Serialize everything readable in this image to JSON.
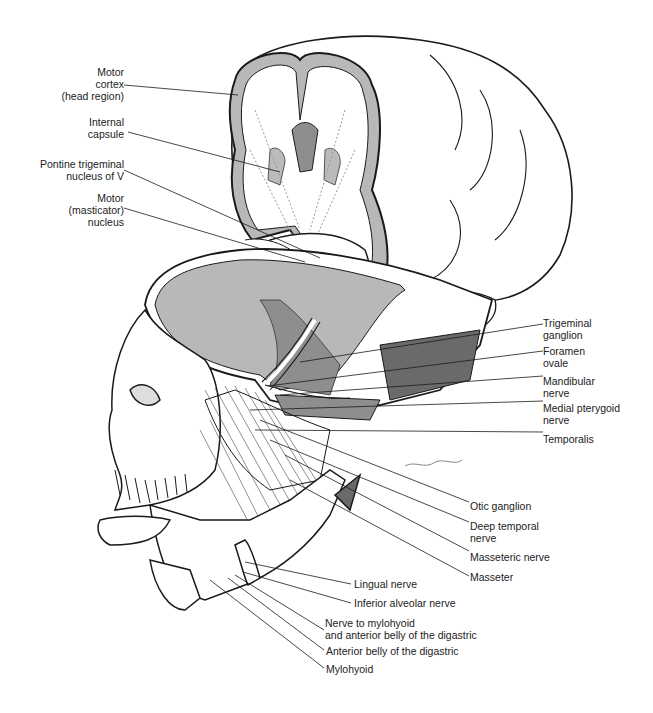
{
  "figure": {
    "left_labels": [
      {
        "lines": [
          "Motor",
          "cortex",
          "(head region)"
        ]
      },
      {
        "lines": [
          "Internal",
          "capsule"
        ]
      },
      {
        "lines": [
          "Pontine trigeminal",
          "nucleus of V"
        ]
      },
      {
        "lines": [
          "Motor",
          "(masticator)",
          "nucleus"
        ]
      }
    ],
    "right_labels": [
      {
        "lines": [
          "Trigeminal",
          "ganglion"
        ]
      },
      {
        "lines": [
          "Foramen",
          "ovale"
        ]
      },
      {
        "lines": [
          "Mandibular",
          "nerve"
        ]
      },
      {
        "lines": [
          "Medial pterygoid",
          "nerve"
        ]
      },
      {
        "lines": [
          "Temporalis"
        ]
      },
      {
        "lines": [
          "Otic ganglion"
        ]
      },
      {
        "lines": [
          "Deep temporal",
          "nerve"
        ]
      },
      {
        "lines": [
          "Masseteric nerve"
        ]
      },
      {
        "lines": [
          "Masseter"
        ]
      }
    ],
    "bottom_labels": [
      {
        "lines": [
          "Lingual nerve"
        ]
      },
      {
        "lines": [
          "Inferior alveolar nerve"
        ]
      },
      {
        "lines": [
          "Nerve to mylohyoid",
          "and anterior belly of the digastric"
        ]
      },
      {
        "lines": [
          "Anterior belly of the digastric"
        ]
      },
      {
        "lines": [
          "Mylohyoid"
        ]
      }
    ],
    "colors": {
      "line": "#1a1a1a",
      "shade_light": "#b8b8b8",
      "shade_mid": "#8e8e8e",
      "shade_dark": "#6a6a6a",
      "paper": "#ffffff"
    }
  }
}
